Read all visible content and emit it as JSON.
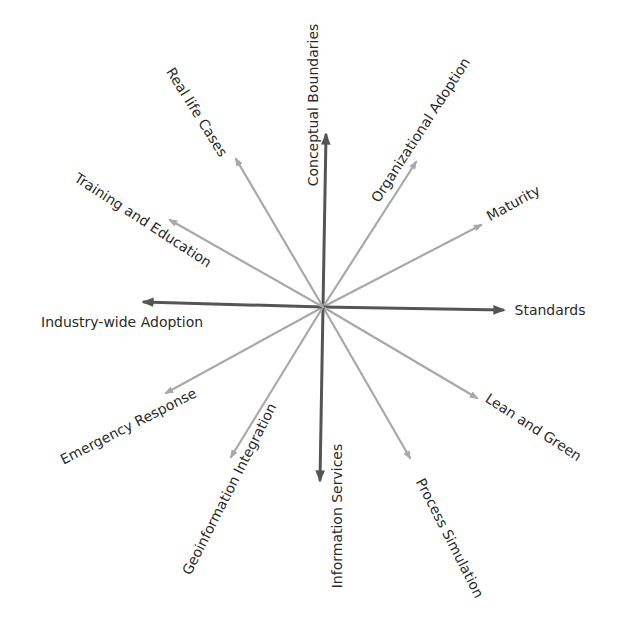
{
  "diagram": {
    "type": "radial-spoke",
    "center": {
      "x": 323,
      "y": 307
    },
    "colors": {
      "dark_arrow": "#555555",
      "light_arrow": "#a8a8a8",
      "text": "#2a2a2a",
      "background": "#ffffff"
    },
    "spokes": [
      {
        "id": "conceptual-boundaries",
        "label": "Conceptual Boundaries",
        "tip": {
          "x": 326,
          "y": 135
        },
        "style": "dark",
        "label_pos": {
          "x": 313,
          "y": 105
        },
        "label_rotate": -90
      },
      {
        "id": "organizational-adoption",
        "label": "Organizational Adoption",
        "tip": {
          "x": 416,
          "y": 162
        },
        "style": "light",
        "label_pos": {
          "x": 420,
          "y": 130
        },
        "label_rotate": -57
      },
      {
        "id": "maturity",
        "label": "Maturity",
        "tip": {
          "x": 481,
          "y": 225
        },
        "style": "light",
        "label_pos": {
          "x": 513,
          "y": 203
        },
        "label_rotate": -29
      },
      {
        "id": "standards",
        "label": "Standards",
        "tip": {
          "x": 503,
          "y": 310
        },
        "style": "dark",
        "label_pos": {
          "x": 550,
          "y": 310
        },
        "label_rotate": 0
      },
      {
        "id": "lean-and-green",
        "label": "Lean and Green",
        "tip": {
          "x": 477,
          "y": 398
        },
        "style": "light",
        "label_pos": {
          "x": 533,
          "y": 427
        },
        "label_rotate": 33
      },
      {
        "id": "process-simulation",
        "label": "Process Simulation",
        "tip": {
          "x": 410,
          "y": 458
        },
        "style": "light",
        "label_pos": {
          "x": 450,
          "y": 538
        },
        "label_rotate": 63
      },
      {
        "id": "information-services",
        "label": "Information Services",
        "tip": {
          "x": 320,
          "y": 480
        },
        "style": "dark",
        "label_pos": {
          "x": 337,
          "y": 516
        },
        "label_rotate": -90
      },
      {
        "id": "geoinformation-integration",
        "label": "Geoinformation Integration",
        "tip": {
          "x": 231,
          "y": 457
        },
        "style": "light",
        "label_pos": {
          "x": 229,
          "y": 489
        },
        "label_rotate": -63
      },
      {
        "id": "emergency-response",
        "label": "Emergency Response",
        "tip": {
          "x": 166,
          "y": 393
        },
        "style": "light",
        "label_pos": {
          "x": 128,
          "y": 426
        },
        "label_rotate": -27
      },
      {
        "id": "industry-wide-adoption",
        "label": "Industry-wide Adoption",
        "tip": {
          "x": 144,
          "y": 302
        },
        "style": "dark",
        "label_pos": {
          "x": 122,
          "y": 322
        },
        "label_rotate": 0
      },
      {
        "id": "training-and-education",
        "label": "Training and Education",
        "tip": {
          "x": 170,
          "y": 220
        },
        "style": "light",
        "label_pos": {
          "x": 143,
          "y": 220
        },
        "label_rotate": 33
      },
      {
        "id": "real-life-cases",
        "label": "Real life Cases",
        "tip": {
          "x": 236,
          "y": 159
        },
        "style": "light",
        "label_pos": {
          "x": 197,
          "y": 112
        },
        "label_rotate": 58
      }
    ]
  }
}
